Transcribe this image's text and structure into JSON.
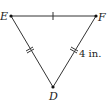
{
  "diagram": {
    "title": "",
    "type": "triangle",
    "vertices": {
      "E": {
        "label": "E",
        "x": 11,
        "y": 16
      },
      "F": {
        "label": "F",
        "x": 96,
        "y": 16
      },
      "D": {
        "label": "D",
        "x": 53,
        "y": 87
      }
    },
    "sides": [
      {
        "from": "E",
        "to": "F",
        "tick_marks": 1
      },
      {
        "from": "E",
        "to": "D",
        "tick_marks": 2
      },
      {
        "from": "F",
        "to": "D",
        "tick_marks": 2,
        "length_label": "4 in."
      }
    ],
    "measurement_label": "4 in.",
    "line_color": "#333333",
    "point_color": "#111111"
  }
}
